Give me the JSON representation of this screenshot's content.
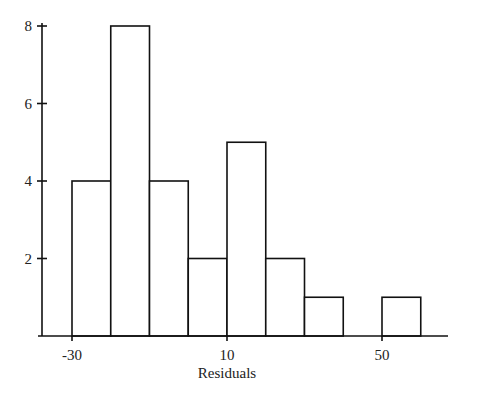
{
  "chart_data": {
    "type": "bar",
    "subtype": "histogram",
    "title": "",
    "xlabel": "Residuals",
    "ylabel": "",
    "bin_width": 10,
    "bins": [
      {
        "start": -30,
        "end": -20,
        "count": 4
      },
      {
        "start": -20,
        "end": -10,
        "count": 8
      },
      {
        "start": -10,
        "end": 0,
        "count": 4
      },
      {
        "start": 0,
        "end": 10,
        "count": 2
      },
      {
        "start": 10,
        "end": 20,
        "count": 5
      },
      {
        "start": 20,
        "end": 30,
        "count": 2
      },
      {
        "start": 30,
        "end": 40,
        "count": 1
      },
      {
        "start": 40,
        "end": 50,
        "count": 0
      },
      {
        "start": 50,
        "end": 60,
        "count": 1
      }
    ],
    "categories": [
      "-30 to -20",
      "-20 to -10",
      "-10 to 0",
      "0 to 10",
      "10 to 20",
      "20 to 30",
      "30 to 40",
      "40 to 50",
      "50 to 60"
    ],
    "values": [
      4,
      8,
      4,
      2,
      5,
      2,
      1,
      0,
      1
    ],
    "x_ticks": [
      -30,
      10,
      50
    ],
    "y_ticks": [
      2,
      4,
      6,
      8
    ],
    "ylim": [
      0,
      8
    ],
    "xlim": [
      -30,
      60
    ],
    "grid": false,
    "legend": null
  }
}
